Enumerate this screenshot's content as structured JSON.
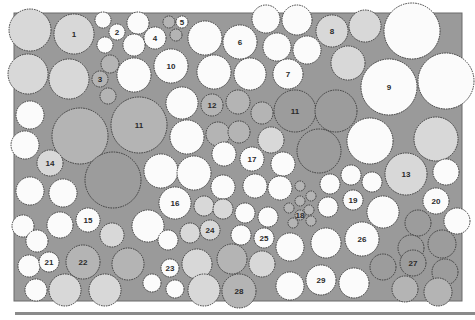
{
  "diagram": {
    "type": "planting-plan",
    "bed_color": "#9a9a9a",
    "shade_colors": {
      "white": "#fbfbfb",
      "light": "#d8d8d8",
      "mid": "#b4b4b4",
      "dark": "#9c9c9c"
    },
    "labels": [
      "1",
      "2",
      "3",
      "4",
      "5",
      "6",
      "7",
      "8",
      "9",
      "10",
      "11",
      "11",
      "12",
      "13",
      "14",
      "15",
      "16",
      "17",
      "18",
      "19",
      "20",
      "21",
      "22",
      "23",
      "24",
      "25",
      "26",
      "27",
      "28",
      "29"
    ],
    "plants": [
      {
        "x": 30,
        "y": 30,
        "r": 21,
        "s": "light"
      },
      {
        "x": 74,
        "y": 34,
        "r": 20,
        "s": "light",
        "label": "1"
      },
      {
        "x": 103,
        "y": 20,
        "r": 8,
        "s": "white"
      },
      {
        "x": 117,
        "y": 32,
        "r": 8,
        "s": "white",
        "label": "2"
      },
      {
        "x": 105,
        "y": 45,
        "r": 8,
        "s": "white"
      },
      {
        "x": 138,
        "y": 23,
        "r": 11,
        "s": "white"
      },
      {
        "x": 134,
        "y": 45,
        "r": 11,
        "s": "white"
      },
      {
        "x": 155,
        "y": 38,
        "r": 11,
        "s": "white",
        "label": "4"
      },
      {
        "x": 169,
        "y": 22,
        "r": 6,
        "s": "mid"
      },
      {
        "x": 182,
        "y": 22,
        "r": 6,
        "s": "white",
        "label": "5"
      },
      {
        "x": 176,
        "y": 35,
        "r": 6,
        "s": "mid"
      },
      {
        "x": 205,
        "y": 38,
        "r": 17,
        "s": "white"
      },
      {
        "x": 240,
        "y": 42,
        "r": 17,
        "s": "white",
        "label": "6"
      },
      {
        "x": 266,
        "y": 19,
        "r": 14,
        "s": "white"
      },
      {
        "x": 297,
        "y": 20,
        "r": 15,
        "s": "white"
      },
      {
        "x": 277,
        "y": 47,
        "r": 14,
        "s": "white"
      },
      {
        "x": 307,
        "y": 50,
        "r": 14,
        "s": "white"
      },
      {
        "x": 332,
        "y": 31,
        "r": 16,
        "s": "light",
        "label": "8"
      },
      {
        "x": 365,
        "y": 26,
        "r": 16,
        "s": "light"
      },
      {
        "x": 412,
        "y": 31,
        "r": 28,
        "s": "white"
      },
      {
        "x": 28,
        "y": 74,
        "r": 20,
        "s": "light"
      },
      {
        "x": 69,
        "y": 79,
        "r": 20,
        "s": "light"
      },
      {
        "x": 110,
        "y": 64,
        "r": 9,
        "s": "mid"
      },
      {
        "x": 100,
        "y": 79,
        "r": 8,
        "s": "mid",
        "label": "3"
      },
      {
        "x": 108,
        "y": 96,
        "r": 8,
        "s": "mid"
      },
      {
        "x": 134,
        "y": 75,
        "r": 17,
        "s": "white"
      },
      {
        "x": 171,
        "y": 66,
        "r": 17,
        "s": "white",
        "label": "10"
      },
      {
        "x": 214,
        "y": 72,
        "r": 17,
        "s": "white"
      },
      {
        "x": 250,
        "y": 74,
        "r": 16,
        "s": "white"
      },
      {
        "x": 288,
        "y": 74,
        "r": 15,
        "s": "white",
        "label": "7"
      },
      {
        "x": 348,
        "y": 63,
        "r": 17,
        "s": "light"
      },
      {
        "x": 389,
        "y": 87,
        "r": 28,
        "s": "white",
        "label": "9"
      },
      {
        "x": 446,
        "y": 81,
        "r": 28,
        "s": "white"
      },
      {
        "x": 30,
        "y": 115,
        "r": 14,
        "s": "white"
      },
      {
        "x": 80,
        "y": 136,
        "r": 28,
        "s": "mid"
      },
      {
        "x": 139,
        "y": 125,
        "r": 28,
        "s": "mid",
        "label": "11"
      },
      {
        "x": 182,
        "y": 103,
        "r": 16,
        "s": "white"
      },
      {
        "x": 212,
        "y": 105,
        "r": 11,
        "s": "mid",
        "label": "12"
      },
      {
        "x": 238,
        "y": 102,
        "r": 12,
        "s": "mid"
      },
      {
        "x": 262,
        "y": 113,
        "r": 11,
        "s": "mid"
      },
      {
        "x": 295,
        "y": 111,
        "r": 21,
        "s": "dark",
        "label": "11"
      },
      {
        "x": 336,
        "y": 111,
        "r": 21,
        "s": "dark"
      },
      {
        "x": 25,
        "y": 145,
        "r": 14,
        "s": "white"
      },
      {
        "x": 50,
        "y": 163,
        "r": 13,
        "s": "light",
        "label": "14"
      },
      {
        "x": 187,
        "y": 137,
        "r": 17,
        "s": "white"
      },
      {
        "x": 218,
        "y": 134,
        "r": 12,
        "s": "mid"
      },
      {
        "x": 239,
        "y": 132,
        "r": 11,
        "s": "mid"
      },
      {
        "x": 271,
        "y": 140,
        "r": 13,
        "s": "light"
      },
      {
        "x": 319,
        "y": 151,
        "r": 22,
        "s": "dark"
      },
      {
        "x": 370,
        "y": 141,
        "r": 23,
        "s": "white"
      },
      {
        "x": 436,
        "y": 139,
        "r": 22,
        "s": "light"
      },
      {
        "x": 113,
        "y": 180,
        "r": 28,
        "s": "dark"
      },
      {
        "x": 161,
        "y": 171,
        "r": 17,
        "s": "white"
      },
      {
        "x": 194,
        "y": 173,
        "r": 17,
        "s": "white"
      },
      {
        "x": 224,
        "y": 154,
        "r": 12,
        "s": "white"
      },
      {
        "x": 252,
        "y": 159,
        "r": 12,
        "s": "white",
        "label": "17"
      },
      {
        "x": 283,
        "y": 164,
        "r": 12,
        "s": "white"
      },
      {
        "x": 30,
        "y": 191,
        "r": 14,
        "s": "white"
      },
      {
        "x": 63,
        "y": 193,
        "r": 14,
        "s": "white"
      },
      {
        "x": 255,
        "y": 186,
        "r": 12,
        "s": "white"
      },
      {
        "x": 223,
        "y": 187,
        "r": 12,
        "s": "white"
      },
      {
        "x": 280,
        "y": 188,
        "r": 12,
        "s": "white"
      },
      {
        "x": 300,
        "y": 186,
        "r": 5,
        "s": "mid"
      },
      {
        "x": 311,
        "y": 196,
        "r": 5,
        "s": "mid"
      },
      {
        "x": 300,
        "y": 201,
        "r": 5,
        "s": "mid"
      },
      {
        "x": 289,
        "y": 208,
        "r": 5,
        "s": "mid"
      },
      {
        "x": 300,
        "y": 215,
        "r": 5,
        "s": "mid",
        "label": "18"
      },
      {
        "x": 311,
        "y": 221,
        "r": 5,
        "s": "mid"
      },
      {
        "x": 309,
        "y": 210,
        "r": 5,
        "s": "mid"
      },
      {
        "x": 293,
        "y": 223,
        "r": 5,
        "s": "mid"
      },
      {
        "x": 330,
        "y": 184,
        "r": 10,
        "s": "white"
      },
      {
        "x": 351,
        "y": 175,
        "r": 10,
        "s": "white"
      },
      {
        "x": 372,
        "y": 182,
        "r": 10,
        "s": "white"
      },
      {
        "x": 406,
        "y": 174,
        "r": 21,
        "s": "light",
        "label": "13"
      },
      {
        "x": 446,
        "y": 172,
        "r": 13,
        "s": "white"
      },
      {
        "x": 23,
        "y": 226,
        "r": 11,
        "s": "white"
      },
      {
        "x": 60,
        "y": 225,
        "r": 13,
        "s": "white"
      },
      {
        "x": 88,
        "y": 220,
        "r": 12,
        "s": "white",
        "label": "15"
      },
      {
        "x": 112,
        "y": 235,
        "r": 12,
        "s": "light"
      },
      {
        "x": 148,
        "y": 226,
        "r": 16,
        "s": "white"
      },
      {
        "x": 175,
        "y": 203,
        "r": 16,
        "s": "white",
        "label": "16"
      },
      {
        "x": 204,
        "y": 206,
        "r": 10,
        "s": "light"
      },
      {
        "x": 223,
        "y": 209,
        "r": 10,
        "s": "light"
      },
      {
        "x": 245,
        "y": 213,
        "r": 10,
        "s": "white"
      },
      {
        "x": 268,
        "y": 217,
        "r": 10,
        "s": "white"
      },
      {
        "x": 328,
        "y": 207,
        "r": 10,
        "s": "white"
      },
      {
        "x": 353,
        "y": 200,
        "r": 10,
        "s": "white",
        "label": "19"
      },
      {
        "x": 383,
        "y": 212,
        "r": 16,
        "s": "white"
      },
      {
        "x": 436,
        "y": 201,
        "r": 13,
        "s": "white",
        "label": "20"
      },
      {
        "x": 457,
        "y": 221,
        "r": 13,
        "s": "white"
      },
      {
        "x": 418,
        "y": 223,
        "r": 13,
        "s": "dark"
      },
      {
        "x": 37,
        "y": 241,
        "r": 11,
        "s": "white"
      },
      {
        "x": 29,
        "y": 266,
        "r": 11,
        "s": "white"
      },
      {
        "x": 49,
        "y": 262,
        "r": 10,
        "s": "white",
        "label": "21"
      },
      {
        "x": 83,
        "y": 262,
        "r": 17,
        "s": "mid",
        "label": "22"
      },
      {
        "x": 128,
        "y": 264,
        "r": 16,
        "s": "mid"
      },
      {
        "x": 168,
        "y": 240,
        "r": 10,
        "s": "white"
      },
      {
        "x": 190,
        "y": 233,
        "r": 10,
        "s": "light"
      },
      {
        "x": 210,
        "y": 230,
        "r": 10,
        "s": "light",
        "label": "24"
      },
      {
        "x": 241,
        "y": 235,
        "r": 10,
        "s": "white"
      },
      {
        "x": 264,
        "y": 238,
        "r": 10,
        "s": "white",
        "label": "25"
      },
      {
        "x": 290,
        "y": 247,
        "r": 14,
        "s": "white"
      },
      {
        "x": 326,
        "y": 243,
        "r": 15,
        "s": "white"
      },
      {
        "x": 362,
        "y": 239,
        "r": 17,
        "s": "white",
        "label": "26"
      },
      {
        "x": 411,
        "y": 248,
        "r": 13,
        "s": "dark"
      },
      {
        "x": 442,
        "y": 244,
        "r": 14,
        "s": "dark"
      },
      {
        "x": 170,
        "y": 268,
        "r": 9,
        "s": "white",
        "label": "23"
      },
      {
        "x": 152,
        "y": 283,
        "r": 9,
        "s": "white"
      },
      {
        "x": 175,
        "y": 289,
        "r": 9,
        "s": "white"
      },
      {
        "x": 197,
        "y": 264,
        "r": 15,
        "s": "light"
      },
      {
        "x": 232,
        "y": 259,
        "r": 15,
        "s": "mid"
      },
      {
        "x": 262,
        "y": 264,
        "r": 13,
        "s": "light"
      },
      {
        "x": 36,
        "y": 290,
        "r": 11,
        "s": "white"
      },
      {
        "x": 65,
        "y": 290,
        "r": 16,
        "s": "light"
      },
      {
        "x": 105,
        "y": 290,
        "r": 16,
        "s": "light"
      },
      {
        "x": 204,
        "y": 290,
        "r": 16,
        "s": "light"
      },
      {
        "x": 239,
        "y": 291,
        "r": 17,
        "s": "mid",
        "label": "28"
      },
      {
        "x": 290,
        "y": 286,
        "r": 14,
        "s": "white"
      },
      {
        "x": 321,
        "y": 280,
        "r": 15,
        "s": "white",
        "label": "29"
      },
      {
        "x": 354,
        "y": 283,
        "r": 15,
        "s": "white"
      },
      {
        "x": 383,
        "y": 267,
        "r": 13,
        "s": "dark"
      },
      {
        "x": 413,
        "y": 263,
        "r": 13,
        "s": "dark",
        "label": "27"
      },
      {
        "x": 445,
        "y": 272,
        "r": 13,
        "s": "dark"
      },
      {
        "x": 405,
        "y": 289,
        "r": 13,
        "s": "mid"
      },
      {
        "x": 438,
        "y": 292,
        "r": 14,
        "s": "mid"
      }
    ]
  }
}
